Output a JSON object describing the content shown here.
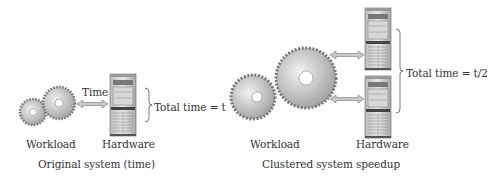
{
  "left_panel": {
    "caption": "Original system (time)",
    "workload_label": "Workload",
    "hardware_label": "Hardware",
    "arrow_label": "Time",
    "total_label": "Total time = t"
  },
  "right_panel": {
    "caption": "Clustered system speedup",
    "workload_label": "Workload",
    "hardware_label": "Hardware",
    "total_label": "Total time = t/2"
  }
}
